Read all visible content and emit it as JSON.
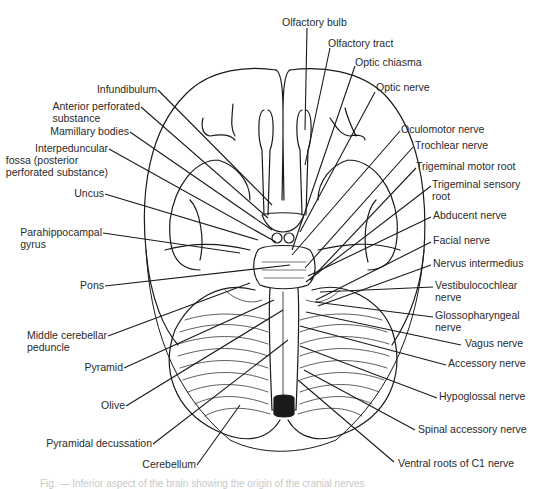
{
  "figure": {
    "title": "Inferior aspect of the brain",
    "caption": "Fig. — Inferior aspect of the brain showing the origin of the cranial nerves",
    "labels_left": [
      {
        "id": "infundibulum",
        "lines": [
          "Infundibulum"
        ],
        "right": 157,
        "top": 83,
        "to": [
          272,
          205
        ]
      },
      {
        "id": "anterior-perforated-substance",
        "lines": [
          "Anterior perforated",
          "substance"
        ],
        "right": 140,
        "top": 100,
        "to": [
          268,
          218
        ]
      },
      {
        "id": "mamillary-bodies",
        "lines": [
          "Mamillary bodies"
        ],
        "right": 129,
        "top": 125,
        "to": [
          272,
          230
        ]
      },
      {
        "id": "interpeduncular-fossa",
        "lines": [
          "Interpeduncular",
          "fossa (posterior",
          "perforated substance)"
        ],
        "right": 108,
        "top": 142,
        "to": [
          276,
          242
        ]
      },
      {
        "id": "uncus",
        "lines": [
          "Uncus"
        ],
        "right": 104,
        "top": 187,
        "to": [
          258,
          240
        ]
      },
      {
        "id": "parahippocampal-gyrus",
        "lines": [
          "Parahippocampal",
          "gyrus"
        ],
        "right": 102,
        "top": 226,
        "to": [
          240,
          253
        ]
      },
      {
        "id": "pons",
        "lines": [
          "Pons"
        ],
        "right": 104,
        "top": 279,
        "to": [
          290,
          265
        ]
      },
      {
        "id": "middle-cerebellar-peduncle",
        "lines": [
          "Middle cerebellar",
          "peduncle"
        ],
        "right": 107,
        "top": 329,
        "to": [
          250,
          283
        ]
      },
      {
        "id": "pyramid",
        "lines": [
          "Pyramid"
        ],
        "right": 123,
        "top": 361,
        "to": [
          274,
          300
        ]
      },
      {
        "id": "olive",
        "lines": [
          "Olive"
        ],
        "right": 125,
        "top": 399,
        "to": [
          283,
          310
        ]
      },
      {
        "id": "pyramidal-decussation",
        "lines": [
          "Pyramidal decussation"
        ],
        "right": 152,
        "top": 437,
        "to": [
          288,
          340
        ]
      },
      {
        "id": "cerebellum",
        "lines": [
          "Cerebellum"
        ],
        "right": 196,
        "top": 458,
        "to": [
          240,
          405
        ]
      }
    ],
    "labels_right": [
      {
        "id": "olfactory-bulb",
        "lines": [
          "Olfactory bulb"
        ],
        "left": 282,
        "top": 16,
        "anchor": [
          307,
          28
        ],
        "to": [
          305,
          130
        ]
      },
      {
        "id": "olfactory-tract",
        "lines": [
          "Olfactory tract"
        ],
        "left": 328,
        "top": 37,
        "anchor": [
          330,
          48
        ],
        "to": [
          305,
          165
        ]
      },
      {
        "id": "optic-chiasma",
        "lines": [
          "Optic chiasma"
        ],
        "left": 355,
        "top": 56,
        "anchor": [
          355,
          66
        ],
        "to": [
          292,
          250
        ]
      },
      {
        "id": "optic-nerve",
        "lines": [
          "Optic nerve"
        ],
        "left": 376,
        "top": 81,
        "anchor": [
          375,
          92
        ],
        "to": [
          300,
          232
        ]
      },
      {
        "id": "oculomotor-nerve",
        "lines": [
          "Oculomotor nerve"
        ],
        "left": 401,
        "top": 123,
        "anchor": [
          400,
          131
        ],
        "to": [
          292,
          255
        ]
      },
      {
        "id": "trochlear-nerve",
        "lines": [
          "Trochlear nerve"
        ],
        "left": 415,
        "top": 139,
        "anchor": [
          413,
          147
        ],
        "to": [
          305,
          268
        ]
      },
      {
        "id": "trigeminal-motor-root",
        "lines": [
          "Trigeminal motor  root"
        ],
        "left": 416,
        "top": 160,
        "anchor": [
          416,
          168
        ],
        "to": [
          310,
          280
        ]
      },
      {
        "id": "trigeminal-sensory-root",
        "lines": [
          "Trigeminal sensory",
          "root"
        ],
        "left": 432,
        "top": 178,
        "anchor": [
          431,
          186
        ],
        "to": [
          306,
          282
        ]
      },
      {
        "id": "abducent-nerve",
        "lines": [
          "Abducent nerve"
        ],
        "left": 433,
        "top": 209,
        "anchor": [
          431,
          217
        ],
        "to": [
          308,
          276
        ]
      },
      {
        "id": "facial-nerve",
        "lines": [
          "Facial nerve"
        ],
        "left": 433,
        "top": 234,
        "anchor": [
          431,
          242
        ],
        "to": [
          316,
          300
        ]
      },
      {
        "id": "nervus-intermedius",
        "lines": [
          "Nervus intermedius"
        ],
        "left": 433,
        "top": 257,
        "anchor": [
          431,
          265
        ],
        "to": [
          318,
          306
        ]
      },
      {
        "id": "vestibulocochlear-nerve",
        "lines": [
          "Vestibulocochlear",
          "nerve"
        ],
        "left": 435,
        "top": 279,
        "anchor": [
          433,
          287
        ],
        "to": [
          320,
          292
        ]
      },
      {
        "id": "glossopharyngeal-nerve",
        "lines": [
          "Glossopharyngeal",
          "nerve"
        ],
        "left": 435,
        "top": 309,
        "anchor": [
          433,
          317
        ],
        "to": [
          315,
          302
        ]
      },
      {
        "id": "vagus-nerve",
        "lines": [
          "Vagus nerve"
        ],
        "left": 465,
        "top": 337,
        "anchor": [
          461,
          345
        ],
        "to": [
          306,
          312
        ]
      },
      {
        "id": "accessory-nerve",
        "lines": [
          "Accessory nerve"
        ],
        "left": 448,
        "top": 357,
        "anchor": [
          446,
          365
        ],
        "to": [
          300,
          326
        ]
      },
      {
        "id": "hypoglossal-nerve",
        "lines": [
          "Hypoglossal nerve"
        ],
        "left": 439,
        "top": 390,
        "anchor": [
          437,
          398
        ],
        "to": [
          300,
          346
        ]
      },
      {
        "id": "spinal-accessory-nerve",
        "lines": [
          "Spinal accessory nerve"
        ],
        "left": 418,
        "top": 423,
        "anchor": [
          415,
          430
        ],
        "to": [
          304,
          370
        ]
      },
      {
        "id": "ventral-roots-of-c1-nerve",
        "lines": [
          "Ventral roots of C1  nerve"
        ],
        "left": 398,
        "top": 457,
        "anchor": [
          394,
          462
        ],
        "to": [
          298,
          380
        ]
      }
    ]
  }
}
